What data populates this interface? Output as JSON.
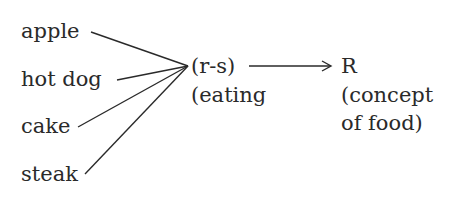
{
  "stimuli": [
    {
      "label": "apple"
    },
    {
      "label": "hot dog"
    },
    {
      "label": "cake"
    },
    {
      "label": "steak"
    }
  ],
  "mediator": {
    "line1": "(r-s)",
    "line2": "(eating"
  },
  "response": {
    "line1": "R",
    "line2": "(concept",
    "line3": "of food)"
  },
  "colors": {
    "ink": "#2a2a2a",
    "background": "#ffffff"
  }
}
